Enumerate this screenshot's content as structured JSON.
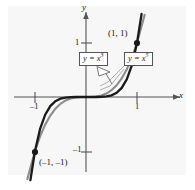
{
  "figure": {
    "background_color": "#f7f7f7",
    "page_color": "#ffffff"
  },
  "axes": {
    "x_label": "x",
    "y_label": "y",
    "x_ticks": [
      {
        "value": -1,
        "label": "–1"
      },
      {
        "value": 1,
        "label": "1"
      }
    ],
    "y_ticks": [
      {
        "value": 1,
        "label": "1"
      },
      {
        "value": -1,
        "label": "–1"
      }
    ],
    "axis_color": "#555555",
    "xlim": [
      -1.55,
      1.55
    ],
    "ylim": [
      -1.55,
      1.55
    ]
  },
  "callouts": [
    {
      "id": "x3",
      "base": "y = x",
      "exponent": "3",
      "full_text": "y = x³",
      "border_color": "#555555"
    },
    {
      "id": "x5",
      "base": "y = x",
      "exponent": "5",
      "full_text": "y = x⁵",
      "border_color": "#555555"
    }
  ],
  "points": [
    {
      "label": "(1, 1)",
      "x": 1,
      "y": 1,
      "marker": "filled-dot",
      "color": "#1a1a1a"
    },
    {
      "label": "(–1, –1)",
      "x": -1,
      "y": -1,
      "marker": "filled-dot",
      "color": "#1a1a1a"
    }
  ],
  "chart_data": {
    "type": "line",
    "title": "",
    "xlabel": "x",
    "ylabel": "y",
    "xlim": [
      -1.55,
      1.55
    ],
    "ylim": [
      -1.55,
      1.55
    ],
    "grid": false,
    "legend": "callout-boxes",
    "x_ticks": [
      -1,
      1
    ],
    "y_ticks": [
      -1,
      1
    ],
    "annotations": [
      "(1, 1)",
      "(–1, –1)",
      "y = x³",
      "y = x⁵"
    ],
    "series": [
      {
        "name": "y = x³",
        "color": "#8c8c8c",
        "x": [
          -1.15,
          -1.0,
          -0.9,
          -0.8,
          -0.7,
          -0.6,
          -0.5,
          -0.4,
          -0.3,
          -0.2,
          -0.1,
          0.0,
          0.1,
          0.2,
          0.3,
          0.4,
          0.5,
          0.6,
          0.7,
          0.8,
          0.9,
          1.0,
          1.15
        ],
        "values": [
          -1.520875,
          -1.0,
          -0.729,
          -0.512,
          -0.343,
          -0.216,
          -0.125,
          -0.064,
          -0.027,
          -0.008,
          -0.001,
          0.0,
          0.001,
          0.008,
          0.027,
          0.064,
          0.125,
          0.216,
          0.343,
          0.512,
          0.729,
          1.0,
          1.520875
        ]
      },
      {
        "name": "y = x⁵",
        "color": "#1a1a1a",
        "x": [
          -1.09,
          -1.0,
          -0.9,
          -0.8,
          -0.7,
          -0.6,
          -0.5,
          -0.4,
          -0.3,
          -0.2,
          -0.1,
          0.0,
          0.1,
          0.2,
          0.3,
          0.4,
          0.5,
          0.6,
          0.7,
          0.8,
          0.9,
          1.0,
          1.09
        ],
        "values": [
          -1.53862,
          -1.0,
          -0.59049,
          -0.32768,
          -0.16807,
          -0.07776,
          -0.03125,
          -0.01024,
          -0.00243,
          -0.00032,
          -1e-05,
          0.0,
          1e-05,
          0.00032,
          0.00243,
          0.01024,
          0.03125,
          0.07776,
          0.16807,
          0.32768,
          0.59049,
          1.0,
          1.53862
        ]
      }
    ]
  }
}
